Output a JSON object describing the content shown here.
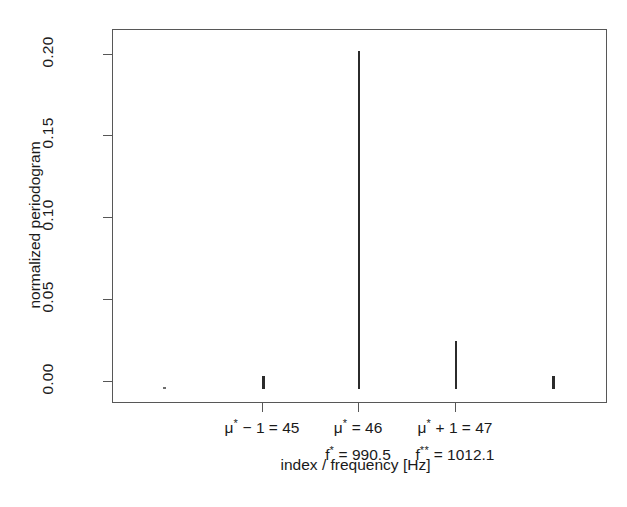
{
  "figure": {
    "background_color": "#ffffff",
    "axis_color": "#575757",
    "data_color": "#2b2b2b"
  },
  "axes": {
    "y_title": "normalized periodogram",
    "x_title": "index / frequency [Hz]",
    "y_ticks": [
      "0.00",
      "0.05",
      "0.10",
      "0.15",
      "0.20"
    ],
    "x_tick_groups": [
      {
        "mu_symbol": "μ",
        "mu_sup": "*",
        "index_expr": " − 1 = 45",
        "freq_symbol": "",
        "freq_sup": "",
        "freq_expr": ""
      },
      {
        "mu_symbol": "μ",
        "mu_sup": "*",
        "index_expr": " = 46",
        "freq_symbol": "f",
        "freq_sup": "*",
        "freq_expr": " = 990.5"
      },
      {
        "mu_symbol": "μ",
        "mu_sup": "*",
        "index_expr": " + 1 = 47",
        "freq_symbol": "f",
        "freq_sup": "**",
        "freq_expr": " = 1012.1"
      }
    ]
  },
  "chart_data": {
    "type": "bar",
    "title": "",
    "subtitle": "",
    "xlabel": "index / frequency [Hz]",
    "ylabel": "normalized periodogram",
    "xlim": [
      41.4,
      51.6
    ],
    "ylim": [
      0.0,
      0.2115
    ],
    "grid": false,
    "legend": null,
    "yticks": [
      0.0,
      0.05,
      0.1,
      0.15,
      0.2
    ],
    "ytick_labels": [
      "0.00",
      "0.05",
      "0.10",
      "0.15",
      "0.20"
    ],
    "xticks": [
      45,
      46,
      47
    ],
    "xtick_labels": [
      "μ* − 1 = 45",
      "μ* = 46",
      "μ* + 1 = 47"
    ],
    "xtick_sublabels": [
      "",
      "f* = 990.5",
      "f** = 1012.1"
    ],
    "categories": [
      43,
      44,
      45,
      46,
      47,
      48,
      49,
      50
    ],
    "values": [
      0.0003,
      0.0,
      0.0018,
      0.2075,
      0.029,
      0.0,
      0.0,
      0.002
    ],
    "series": [
      {
        "name": "normalized periodogram",
        "x": [
          43,
          44,
          45,
          46,
          47,
          48,
          49,
          50
        ],
        "values": [
          0.0003,
          0.0,
          0.0018,
          0.2075,
          0.029,
          0.0,
          0.0,
          0.002
        ]
      }
    ],
    "annotations": [
      {
        "text": "f* = 990.5",
        "at_index": 46
      },
      {
        "text": "f** = 1012.1",
        "at_index": 47
      }
    ]
  },
  "marks": [
    {
      "name": "dot-left",
      "x_px": 163,
      "height_px": 2,
      "width_px": 3,
      "tiny": true
    },
    {
      "name": "spike-45",
      "x_px": 262,
      "height_px": 13,
      "width_px": 3,
      "tiny": false
    },
    {
      "name": "spike-46",
      "x_px": 358,
      "height_px": 338,
      "width_px": 2,
      "tiny": false
    },
    {
      "name": "spike-47",
      "x_px": 455,
      "height_px": 48,
      "width_px": 2,
      "tiny": false
    },
    {
      "name": "spike-right",
      "x_px": 552,
      "height_px": 13,
      "width_px": 3,
      "tiny": false
    }
  ],
  "layout": {
    "ytick_y_px": [
      381,
      299,
      217,
      135,
      54
    ],
    "xtick_x_px": [
      262,
      358,
      455
    ]
  }
}
